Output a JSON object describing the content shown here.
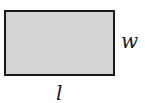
{
  "diagram": {
    "shape": "rectangle",
    "fill_color": "#d4d4d4",
    "border_color": "#1a1a1a",
    "labels": {
      "width": "w",
      "length": "l"
    }
  }
}
